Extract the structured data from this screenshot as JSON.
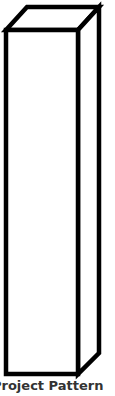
{
  "diagram": {
    "shape": "rectangular-prism",
    "stroke_color": "#000000",
    "fill_color": "#ffffff",
    "caption": "Project Pattern"
  }
}
